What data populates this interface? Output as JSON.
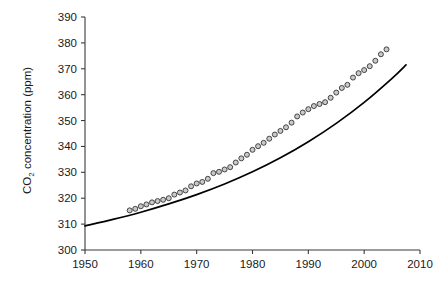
{
  "chart_data": {
    "type": "scatter",
    "title": "",
    "xlabel": "",
    "ylabel": "CO2 concentration (ppm)",
    "ylabel_parts": {
      "prefix": "CO",
      "subscript": "2",
      "suffix": " concentration (ppm)"
    },
    "xlim": [
      1950,
      2010
    ],
    "ylim": [
      300,
      390
    ],
    "xticks": [
      1950,
      1960,
      1970,
      1980,
      1990,
      2000,
      2010
    ],
    "xtick_labels": [
      "1950",
      "1960",
      "1970",
      "1980",
      "1990",
      "2000",
      "2010"
    ],
    "yticks": [
      300,
      310,
      320,
      330,
      340,
      350,
      360,
      370,
      380,
      390
    ],
    "ytick_labels": [
      "300",
      "310",
      "320",
      "330",
      "340",
      "350",
      "360",
      "370",
      "380",
      "390"
    ],
    "grid": false,
    "legend": null,
    "marker_style": {
      "shape": "circle",
      "fill": "#c9c9c9",
      "edge": "#2b2b2b",
      "size_px": 5
    },
    "series": [
      {
        "name": "Observed CO2 concentration",
        "type": "scatter",
        "x": [
          1958,
          1959,
          1960,
          1961,
          1962,
          1963,
          1964,
          1965,
          1966,
          1967,
          1968,
          1969,
          1970,
          1971,
          1972,
          1973,
          1974,
          1975,
          1976,
          1977,
          1978,
          1979,
          1980,
          1981,
          1982,
          1983,
          1984,
          1985,
          1986,
          1987,
          1988,
          1989,
          1990,
          1991,
          1992,
          1993,
          1994,
          1995,
          1996,
          1997,
          1998,
          1999,
          2000,
          2001,
          2002,
          2003,
          2004
        ],
        "values": [
          315.3,
          315.9,
          316.9,
          317.6,
          318.4,
          318.9,
          319.4,
          320.0,
          321.4,
          322.2,
          323.0,
          324.6,
          325.7,
          326.3,
          327.5,
          329.7,
          330.2,
          331.1,
          332.0,
          333.8,
          335.4,
          336.8,
          338.7,
          340.1,
          341.4,
          343.0,
          344.6,
          346.0,
          347.4,
          349.2,
          351.6,
          353.1,
          354.4,
          355.6,
          356.4,
          357.1,
          358.8,
          360.8,
          362.6,
          363.8,
          366.6,
          368.3,
          369.5,
          371.0,
          373.1,
          375.6,
          377.5
        ]
      },
      {
        "name": "Fitted trend",
        "type": "line",
        "x": [
          1950,
          1955,
          1960,
          1965,
          1970,
          1975,
          1980,
          1985,
          1990,
          1995,
          2000,
          2005,
          2007.5
        ],
        "values": [
          309.3,
          311.8,
          314.6,
          317.8,
          321.4,
          325.5,
          330.2,
          335.6,
          341.8,
          348.9,
          357.0,
          366.3,
          371.5
        ]
      }
    ]
  }
}
